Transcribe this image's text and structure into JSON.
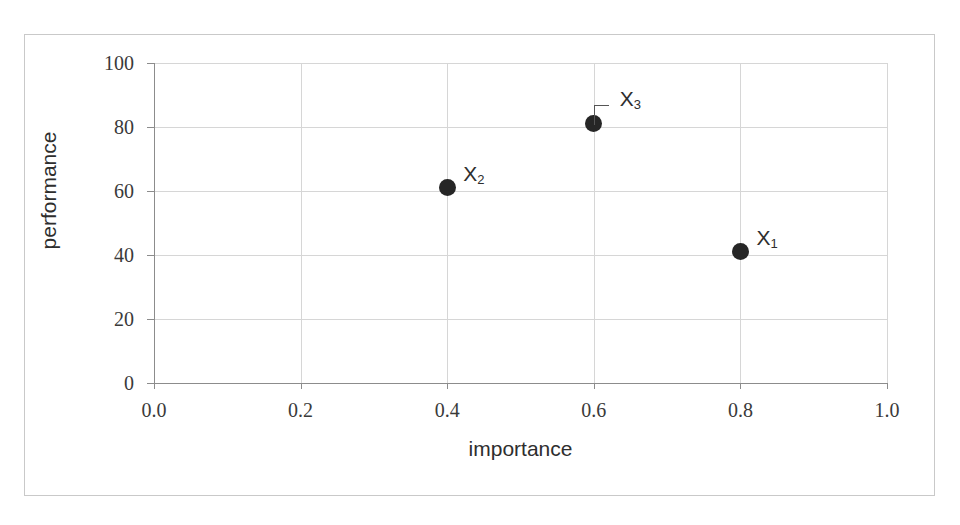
{
  "chart_data": {
    "type": "scatter",
    "title": "",
    "xlabel": "importance",
    "ylabel": "performance",
    "xlim": [
      0.0,
      1.0
    ],
    "ylim": [
      0,
      100
    ],
    "grid": true,
    "legend": "none",
    "x_ticks": [
      "0.0",
      "0.2",
      "0.4",
      "0.6",
      "0.8",
      "1.0"
    ],
    "x_tick_values": [
      0.0,
      0.2,
      0.4,
      0.6,
      0.8,
      1.0
    ],
    "y_ticks": [
      "0",
      "20",
      "40",
      "60",
      "80",
      "100"
    ],
    "y_tick_values": [
      0,
      20,
      40,
      60,
      80,
      100
    ],
    "points": [
      {
        "label": "X",
        "subscript": "1",
        "x": 0.8,
        "y": 41
      },
      {
        "label": "X",
        "subscript": "2",
        "x": 0.4,
        "y": 61
      },
      {
        "label": "X",
        "subscript": "3",
        "x": 0.6,
        "y": 81
      }
    ],
    "marker_color": "#262626",
    "grid_color": "#d6d6d6",
    "axis_color": "#8c8c8c",
    "frame_color": "#c9c9c9",
    "background_color": "#ffffff"
  }
}
